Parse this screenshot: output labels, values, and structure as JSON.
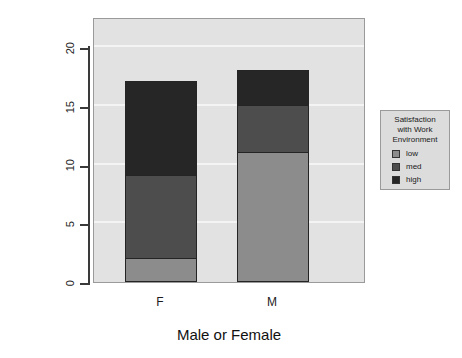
{
  "chart_data": {
    "type": "bar",
    "bar_mode": "stacked",
    "title": "",
    "xlabel": "Male or Female",
    "ylabel": "Frequency",
    "categories": [
      "F",
      "M"
    ],
    "series": [
      {
        "name": "low",
        "values": [
          2,
          11
        ],
        "color": "#8c8c8c"
      },
      {
        "name": "med",
        "values": [
          7,
          4
        ],
        "color": "#4d4d4d"
      },
      {
        "name": "high",
        "values": [
          8,
          3
        ],
        "color": "#262626"
      }
    ],
    "totals": [
      17,
      18
    ],
    "ylim": [
      0,
      22.6
    ],
    "yticks": [
      0,
      5,
      10,
      15,
      20
    ],
    "ytick_labels": [
      "0",
      "5",
      "10",
      "15",
      "20"
    ],
    "grid": true,
    "gridlines_at": [
      5,
      10,
      15,
      20
    ],
    "legend_position": "right-outside",
    "panel_background": "#e2e2e2",
    "gridline_color": "#f4f4f4"
  },
  "legend": {
    "title_lines": [
      "Satisfaction",
      "with Work",
      "Environment"
    ],
    "items": [
      {
        "label": "low",
        "color": "#8c8c8c"
      },
      {
        "label": "med",
        "color": "#4d4d4d"
      },
      {
        "label": "high",
        "color": "#262626"
      }
    ]
  },
  "axes": {
    "y_title": "Frequency",
    "x_title": "Male or Female",
    "y_tick_labels": [
      "0",
      "5",
      "10",
      "15",
      "20"
    ],
    "x_tick_labels": [
      "F",
      "M"
    ]
  }
}
